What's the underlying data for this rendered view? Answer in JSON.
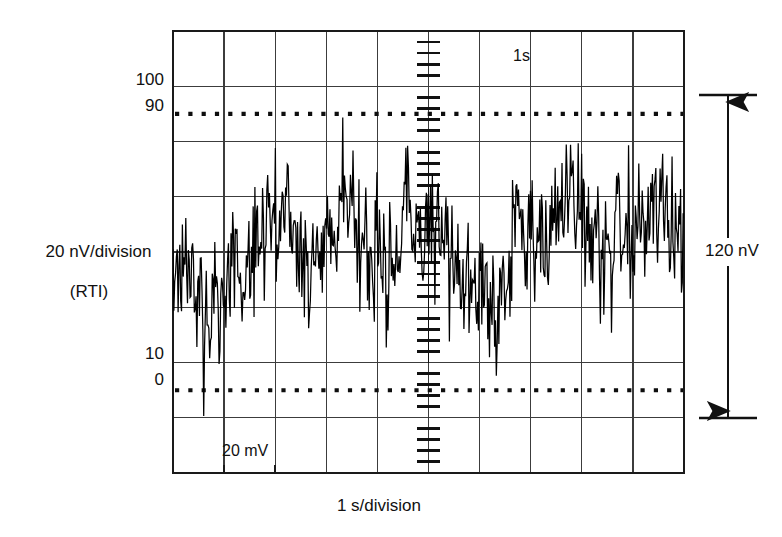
{
  "figure": {
    "type": "oscilloscope-noise-trace",
    "background_color": "#ffffff",
    "trace_color": "#000000",
    "grid_color": "#3a3a3a",
    "border_color": "#1a1a1a"
  },
  "axes": {
    "y_axis_label_line1": "20 nV/division",
    "y_axis_label_line2": "(RTI)",
    "x_axis_label": "1 s/division",
    "y_tick_labels": [
      "100",
      "90",
      "10",
      "0"
    ],
    "y_tick_label_100": "100",
    "y_tick_label_90": "90",
    "y_tick_label_10": "10",
    "y_tick_label_0": "0"
  },
  "annotations": {
    "timebase_marker": "1s",
    "amplitude_marker": "20 mV",
    "span_label": "120 nV"
  },
  "chart_data": {
    "type": "line",
    "title": "",
    "subtitle": "",
    "xlabel": "1 s/division",
    "ylabel": "20 nV/division (RTI)",
    "xlim": [
      0,
      10
    ],
    "ylim": [
      0,
      8
    ],
    "x_divisions": 10,
    "y_divisions": 8,
    "x_units_per_division": "1 s",
    "y_units_per_division": "20 nV",
    "grid": true,
    "legend": "none",
    "reference_lines": [
      {
        "name": "90-percent",
        "y_label": "90",
        "style": "dotted",
        "y_division": 6.0
      },
      {
        "name": "0-percent",
        "y_label": "0",
        "style": "dotted",
        "y_division": 2.0
      }
    ],
    "solid_gridline_labels": [
      {
        "name": "100-percent",
        "y_label": "100",
        "y_division": 6.5
      },
      {
        "name": "10-percent",
        "y_label": "10",
        "y_division": 2.5
      }
    ],
    "annotations": [
      {
        "text": "1s",
        "x_division": 6.75,
        "y_division": 7.4
      },
      {
        "text": "20 mV",
        "x_division": 1.1,
        "y_division": 0.45
      },
      {
        "text": "120 nV",
        "position": "right-of-plot",
        "span_divisions": 6.0
      }
    ],
    "series": [
      {
        "name": "0.1 Hz to 10 Hz noise",
        "peak_to_peak_nV": 120,
        "samples_per_division": 60,
        "description": "Random broadband voltage noise centered at mid-screen, approximately 120 nV peak-to-peak (6 divisions at 20 nV/division)."
      }
    ]
  }
}
